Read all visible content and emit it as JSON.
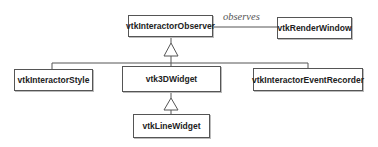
{
  "diagram": {
    "type": "uml-class-hierarchy",
    "classes": {
      "observer": "vtkInteractorObserver",
      "render_window": "vtkRenderWindow",
      "interactor_style": "vtkInteractorStyle",
      "widget3d": "vtk3DWidget",
      "event_recorder": "vtkInteractorEventRecorder",
      "line_widget": "vtkLineWidget"
    },
    "associations": [
      {
        "from": "vtkInteractorObserver",
        "to": "vtkRenderWindow",
        "label": "observes"
      }
    ],
    "inheritance": [
      {
        "child": "vtkInteractorStyle",
        "parent": "vtkInteractorObserver"
      },
      {
        "child": "vtk3DWidget",
        "parent": "vtkInteractorObserver"
      },
      {
        "child": "vtkInteractorEventRecorder",
        "parent": "vtkInteractorObserver"
      },
      {
        "child": "vtkLineWidget",
        "parent": "vtk3DWidget"
      }
    ],
    "association_label": "observes",
    "colors": {
      "line": "#555555",
      "text": "#222222",
      "label": "#555555"
    }
  }
}
